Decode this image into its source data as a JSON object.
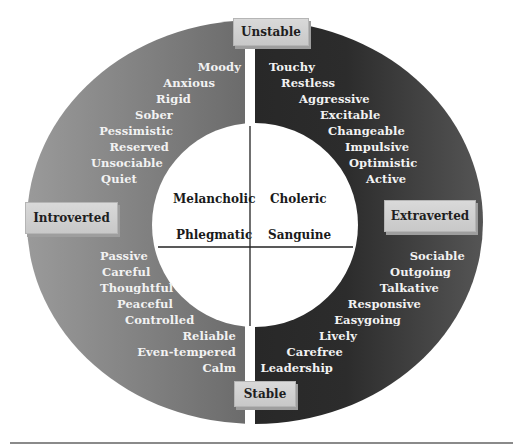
{
  "diagram": {
    "axes": {
      "top": "Unstable",
      "bottom": "Stable",
      "left": "Introverted",
      "right": "Extraverted"
    },
    "quadrants": {
      "top_left": "Melancholic",
      "top_right": "Choleric",
      "bottom_left": "Phlegmatic",
      "bottom_right": "Sanguine"
    },
    "traits": {
      "top_left": [
        "Moody",
        "Anxious",
        "Rigid",
        "Sober",
        "Pessimistic",
        "Reserved",
        "Unsociable",
        "Quiet"
      ],
      "top_right": [
        "Touchy",
        "Restless",
        "Aggressive",
        "Excitable",
        "Changeable",
        "Impulsive",
        "Optimistic",
        "Active"
      ],
      "bottom_left": [
        "Passive",
        "Careful",
        "Thoughtful",
        "Peaceful",
        "Controlled",
        "Reliable",
        "Even-tempered",
        "Calm"
      ],
      "bottom_right": [
        "Sociable",
        "Outgoing",
        "Talkative",
        "Responsive",
        "Easygoing",
        "Lively",
        "Carefree",
        "Leadership"
      ]
    },
    "colors": {
      "ring_left_light": "#8c8c8c",
      "ring_left_dark": "#3a3a3a",
      "ring_right": "#262626",
      "inner_circle": "#ffffff",
      "label_box": "#d0d0d0",
      "trait_text": "#f2f2f2"
    }
  }
}
